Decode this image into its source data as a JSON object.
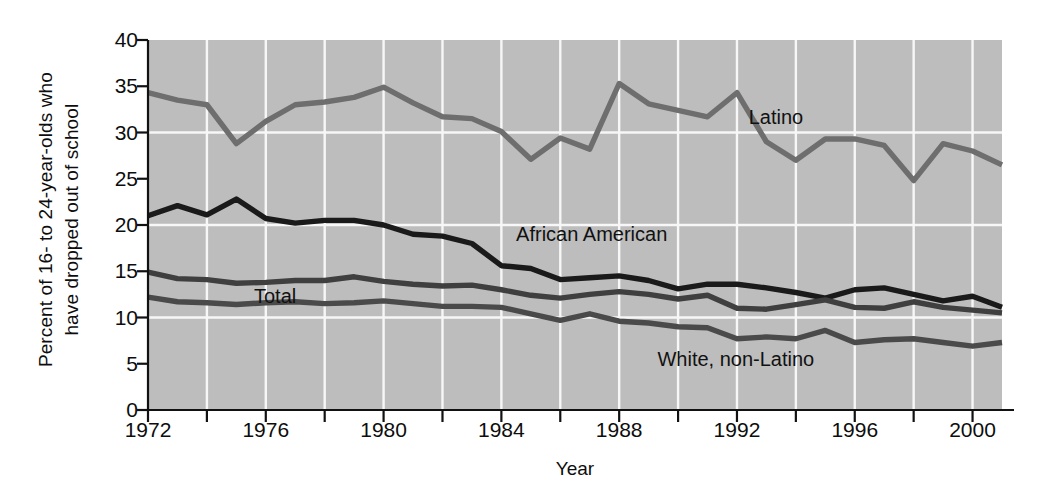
{
  "chart_data": {
    "type": "line",
    "title": "",
    "xlabel": "Year",
    "ylabel_line1": "Percent of 16- to 24-year-olds who",
    "ylabel_line2": "have dropped out of school",
    "ylim": [
      0,
      40
    ],
    "xlim": [
      1972,
      2001
    ],
    "yticks": [
      0,
      5,
      10,
      15,
      20,
      25,
      30,
      35,
      40
    ],
    "xticks": [
      1972,
      1976,
      1980,
      1984,
      1988,
      1992,
      1996,
      2000
    ],
    "xgrid_years": [
      1972,
      1974,
      1976,
      1978,
      1980,
      1982,
      1984,
      1986,
      1988,
      1990,
      1992,
      1994,
      1996,
      1998,
      2000
    ],
    "grid": true,
    "grid_color": "#f2f2f2",
    "plot_background": "#bdbdbd",
    "legend_position": "inline-labels",
    "x": [
      1972,
      1973,
      1974,
      1975,
      1976,
      1977,
      1978,
      1979,
      1980,
      1981,
      1982,
      1983,
      1984,
      1985,
      1986,
      1987,
      1988,
      1989,
      1990,
      1991,
      1992,
      1993,
      1994,
      1995,
      1996,
      1997,
      1998,
      1999,
      2000,
      2001
    ],
    "series": [
      {
        "name": "Latino",
        "color": "#6e6e6e",
        "label": "Latino",
        "label_x": 1992.4,
        "label_y": 31.5,
        "values": [
          34.3,
          33.5,
          33.0,
          28.8,
          31.2,
          33.0,
          33.3,
          33.8,
          34.9,
          33.2,
          31.7,
          31.5,
          30.1,
          27.1,
          29.4,
          28.2,
          35.3,
          33.1,
          32.4,
          31.7,
          34.3,
          29.0,
          27.0,
          29.3,
          29.3,
          28.6,
          24.8,
          28.8,
          28.0,
          26.5
        ]
      },
      {
        "name": "African American",
        "color": "#1a1a1a",
        "label": "African American",
        "label_x": 1984.5,
        "label_y": 18.8,
        "values": [
          21.0,
          22.1,
          21.1,
          22.8,
          20.7,
          20.2,
          20.5,
          20.5,
          20.0,
          19.0,
          18.8,
          18.0,
          15.6,
          15.3,
          14.1,
          14.3,
          14.5,
          14.0,
          13.1,
          13.6,
          13.6,
          13.2,
          12.7,
          12.1,
          13.0,
          13.2,
          12.5,
          11.8,
          12.3,
          11.1
        ]
      },
      {
        "name": "Total",
        "color": "#3f3f3f",
        "label": "Total",
        "label_x": 1975.6,
        "label_y": 12.1,
        "values": [
          14.9,
          14.2,
          14.1,
          13.7,
          13.8,
          14.0,
          14.0,
          14.4,
          13.9,
          13.6,
          13.4,
          13.5,
          13.0,
          12.4,
          12.1,
          12.5,
          12.8,
          12.5,
          12.0,
          12.4,
          11.0,
          10.9,
          11.4,
          11.9,
          11.1,
          11.0,
          11.7,
          11.1,
          10.8,
          10.5
        ]
      },
      {
        "name": "White, non-Latino",
        "color": "#4a4a4a",
        "label": "White, non-Latino",
        "label_x": 1989.3,
        "label_y": 5.3,
        "values": [
          12.2,
          11.7,
          11.6,
          11.4,
          11.6,
          11.7,
          11.5,
          11.6,
          11.8,
          11.5,
          11.2,
          11.2,
          11.1,
          10.4,
          9.7,
          10.4,
          9.6,
          9.4,
          9.0,
          8.9,
          7.7,
          7.9,
          7.7,
          8.6,
          7.3,
          7.6,
          7.7,
          7.3,
          6.9,
          7.3
        ]
      }
    ]
  }
}
